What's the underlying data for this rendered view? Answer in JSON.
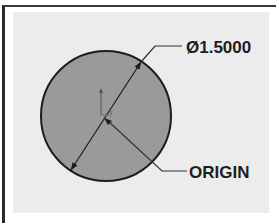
{
  "diagram": {
    "type": "cad-sketch-circle",
    "dimension": {
      "symbol": "Ø",
      "value": "1.5000",
      "label": "Ø1.5000"
    },
    "origin_callout": {
      "label": "ORIGIN"
    },
    "circle": {
      "fill": "#9a9a9a",
      "stroke": "#1c1c1c",
      "center": [
        106,
        116
      ],
      "radius": 65
    },
    "colors": {
      "background": "#ececec",
      "frame": "#2a2a2a",
      "text": "#1e1e1e",
      "leader": "#303030"
    }
  }
}
